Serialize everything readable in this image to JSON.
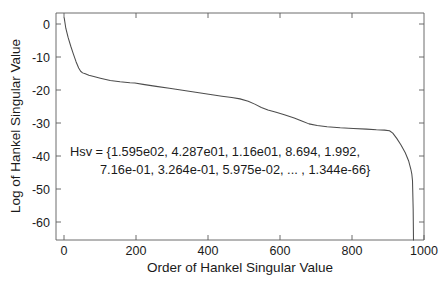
{
  "chart_data": {
    "type": "line",
    "title": "",
    "xlabel": "Order of Hankel Singular Value",
    "ylabel": "Log of Hankel Singular Value",
    "xlim": [
      -25,
      1095
    ],
    "ylim": [
      -65.5,
      3.5
    ],
    "grid": false,
    "legend": null,
    "xticks": [
      0,
      200,
      400,
      600,
      800,
      1000
    ],
    "xtick_labels": [
      "0",
      "200",
      "400",
      "600",
      "800",
      "1000"
    ],
    "yticks": [
      0,
      -10,
      -20,
      -30,
      -40,
      -50,
      -60
    ],
    "ytick_labels": [
      "0",
      "-10",
      "-20",
      "-30",
      "-40",
      "-50",
      "-60"
    ],
    "series": [
      {
        "name": "Log of Hankel Singular Value",
        "color": "#4d4d4d",
        "x": [
          0,
          5,
          12,
          20,
          28,
          36,
          44,
          50,
          56,
          64,
          75,
          90,
          110,
          140,
          170,
          200,
          215,
          240,
          280,
          320,
          360,
          400,
          440,
          480,
          510,
          535,
          560,
          580,
          600,
          620,
          645,
          670,
          700,
          725,
          745,
          770,
          800,
          840,
          880,
          920,
          950,
          975,
          990,
          1000,
          1012,
          1025,
          1038,
          1048,
          1055,
          1058,
          1060,
          1062,
          1063
        ],
        "y": [
          2.0,
          -1.2,
          -4.0,
          -6.6,
          -9.0,
          -11.3,
          -13.2,
          -14.2,
          -14.7,
          -15.0,
          -15.4,
          -15.8,
          -16.3,
          -17.0,
          -17.4,
          -17.7,
          -17.8,
          -18.2,
          -18.8,
          -19.4,
          -20.0,
          -20.6,
          -21.2,
          -21.8,
          -22.2,
          -22.6,
          -23.3,
          -24.2,
          -25.2,
          -26.0,
          -26.7,
          -27.4,
          -28.4,
          -29.4,
          -30.2,
          -30.7,
          -31.1,
          -31.4,
          -31.6,
          -31.8,
          -32.0,
          -32.1,
          -32.3,
          -33.0,
          -34.6,
          -36.6,
          -39.0,
          -41.4,
          -44.0,
          -45.5,
          -47.5,
          -56.0,
          -65.5
        ]
      }
    ],
    "annotations": [
      {
        "name": "hsv-values-annotation",
        "line1": "Hsv = {1.595e02, 4.287e01, 1.16e01, 8.694, 1.992,",
        "line2": "7.16e-01, 3.264e-01, 5.975e-02, ... , 1.344e-66}"
      }
    ]
  }
}
